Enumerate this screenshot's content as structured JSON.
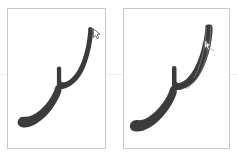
{
  "canvas": {
    "width": 238,
    "height": 160,
    "background_color": "#ffffff",
    "guide_line_color": "#ededed",
    "guide_line_y": 74
  },
  "panels": [
    {
      "id": "left",
      "name": "calligraphy-panel-left",
      "x": 7,
      "y": 8,
      "width": 99,
      "height": 141,
      "background_color": "#ffffff",
      "border_color": "#c8c8c8",
      "stroke": {
        "name": "arabic-letter-stroke",
        "fill_color": "#3b3b3b",
        "description": "calligraphic arabic lam-like descending stroke"
      },
      "cursor_marker": {
        "name": "pen-tip-cursor",
        "x": 87,
        "y": 24,
        "outline_color": "#5a5a5a",
        "fill_color": "#ffffff"
      },
      "has_outline_annotation": false
    },
    {
      "id": "right",
      "name": "calligraphy-panel-right",
      "x": 123,
      "y": 8,
      "width": 107,
      "height": 141,
      "background_color": "#ffffff",
      "border_color": "#c8c8c8",
      "stroke": {
        "name": "arabic-letter-stroke",
        "fill_color": "#3b3b3b",
        "description": "calligraphic arabic lam-like descending stroke"
      },
      "cursor_marker": {
        "name": "pen-tip-cursor",
        "x": 82,
        "y": 38,
        "outline_color": "#5a5a5a",
        "fill_color": "#ffffff"
      },
      "has_outline_annotation": true,
      "outline_annotation": {
        "name": "stroke-skeleton-outline",
        "color": "#8c8c8c"
      }
    }
  ]
}
